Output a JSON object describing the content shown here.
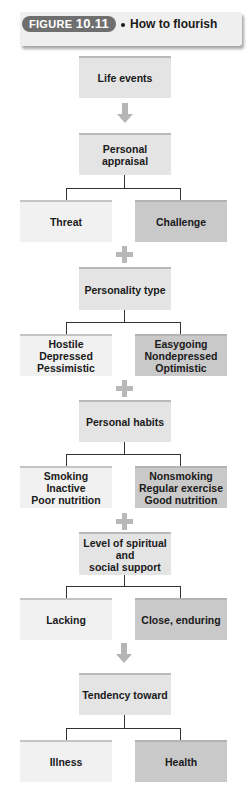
{
  "header": {
    "badge_prefix": "FIGURE ",
    "badge_number": "10.11",
    "title": "How to flourish"
  },
  "diagram": {
    "steps": [
      {
        "center": "Life events"
      },
      {
        "center": "Personal appraisal",
        "left": "Threat",
        "right": "Challenge"
      },
      {
        "center": "Personality type",
        "left": [
          "Hostile",
          "Depressed",
          "Pessimistic"
        ],
        "right": [
          "Easygoing",
          "Nondepressed",
          "Optimistic"
        ]
      },
      {
        "center": "Personal habits",
        "left": [
          "Smoking",
          "Inactive",
          "Poor nutrition"
        ],
        "right": [
          "Nonsmoking",
          "Regular exercise",
          "Good nutrition"
        ]
      },
      {
        "center": [
          "Level of spiritual and",
          "social support"
        ],
        "left": "Lacking",
        "right": "Close, enduring"
      },
      {
        "center": "Tendency toward",
        "left": "Illness",
        "right": "Health"
      }
    ],
    "connectors": [
      "arrow",
      "plus",
      "plus",
      "plus",
      "arrow"
    ]
  },
  "colors": {
    "center_box": "#e4e4e4",
    "left_box": "#f1f1f1",
    "right_box": "#c9c9c9",
    "badge": "#6f6f6f",
    "connector": "#b8b8b8"
  }
}
